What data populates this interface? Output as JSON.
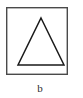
{
  "figure": {
    "caption": "b",
    "panel_label": "b",
    "frame": {
      "shape_name": "rectangle-border",
      "x": 6,
      "y": 7,
      "width": 62,
      "height": 68,
      "stroke_color": "#4a4a4a",
      "stroke_width": 1.4,
      "fill_color": "#ffffff"
    },
    "shape": {
      "shape_name": "triangle",
      "type": "isosceles-triangle",
      "apex": {
        "x": 41,
        "y": 18
      },
      "base_left": {
        "x": 18,
        "y": 65
      },
      "base_right": {
        "x": 64,
        "y": 65
      },
      "stroke_color": "#1a1a1a",
      "stroke_width": 1.5,
      "fill_color": "none"
    },
    "background_color": "#ffffff"
  }
}
